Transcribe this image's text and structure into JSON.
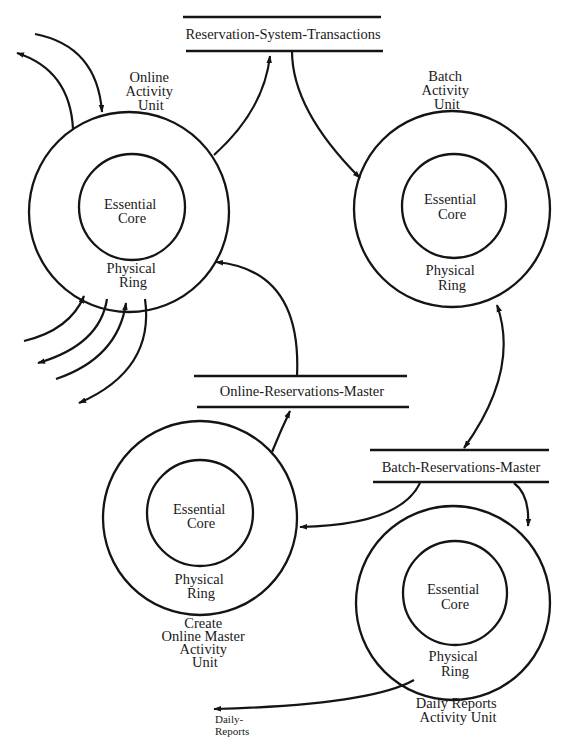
{
  "diagram": {
    "type": "activity-unit diagram",
    "units": [
      {
        "id": "online",
        "title_lines": [
          "Online",
          "Activity",
          "Unit"
        ],
        "core_lines": [
          "Essential",
          "Core"
        ],
        "ring_lines": [
          "Physical",
          "Ring"
        ]
      },
      {
        "id": "batch",
        "title_lines": [
          "Batch",
          "Activity",
          "Unit"
        ],
        "core_lines": [
          "Essential",
          "Core"
        ],
        "ring_lines": [
          "Physical",
          "Ring"
        ]
      },
      {
        "id": "create_online_master",
        "title_lines": [
          "Create",
          "Online Master",
          "Activity",
          "Unit"
        ],
        "core_lines": [
          "Essential",
          "Core"
        ],
        "ring_lines": [
          "Physical",
          "Ring"
        ]
      },
      {
        "id": "daily_reports",
        "title_lines": [
          "Daily Reports",
          "Activity Unit"
        ],
        "core_lines": [
          "Essential",
          "Core"
        ],
        "ring_lines": [
          "Physical",
          "Ring"
        ]
      }
    ],
    "stores": [
      {
        "id": "rst",
        "label": "Reservation-System-Transactions"
      },
      {
        "id": "orm",
        "label": "Online-Reservations-Master"
      },
      {
        "id": "brm",
        "label": "Batch-Reservations-Master"
      }
    ],
    "external_flows": [
      {
        "id": "daily_reports_out",
        "label_lines": [
          "Daily-",
          "Reports"
        ]
      }
    ],
    "flows": [
      {
        "from": "external",
        "to": "online",
        "direction": "in"
      },
      {
        "from": "online",
        "to": "external",
        "direction": "out"
      },
      {
        "from": "external",
        "to": "online",
        "direction": "in"
      },
      {
        "from": "online",
        "to": "external",
        "direction": "out"
      },
      {
        "from": "external",
        "to": "online",
        "direction": "in"
      },
      {
        "from": "online",
        "to": "external",
        "direction": "out"
      },
      {
        "from": "online",
        "to": "Reservation-System-Transactions"
      },
      {
        "from": "Reservation-System-Transactions",
        "to": "batch"
      },
      {
        "from": "batch",
        "to": "Batch-Reservations-Master",
        "bidirectional": true
      },
      {
        "from": "Batch-Reservations-Master",
        "to": "create_online_master"
      },
      {
        "from": "Batch-Reservations-Master",
        "to": "daily_reports"
      },
      {
        "from": "create_online_master",
        "to": "Online-Reservations-Master"
      },
      {
        "from": "Online-Reservations-Master",
        "to": "online"
      },
      {
        "from": "daily_reports",
        "to": "Daily-Reports"
      }
    ]
  }
}
